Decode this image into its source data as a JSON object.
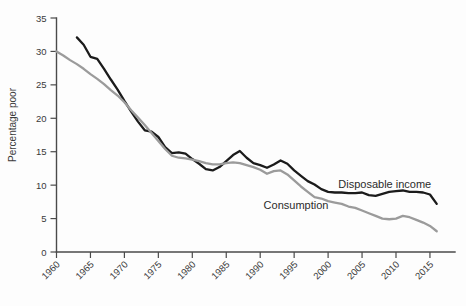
{
  "chart_data": {
    "type": "line",
    "title": "",
    "xlabel": "",
    "ylabel": "Percentage poor",
    "xlim": [
      1960,
      2017
    ],
    "ylim": [
      0,
      35
    ],
    "grid": false,
    "legend_position": "inline-annotations",
    "x_ticks": [
      1960,
      1965,
      1970,
      1975,
      1980,
      1985,
      1990,
      1995,
      2000,
      2005,
      2010,
      2015
    ],
    "x_tick_labels": [
      "1960",
      "1965",
      "1970",
      "1975",
      "1980",
      "1985",
      "1990",
      "1995",
      "2000",
      "2005",
      "2010",
      "2015"
    ],
    "y_ticks": [
      0,
      5,
      10,
      15,
      20,
      25,
      30,
      35
    ],
    "y_tick_labels": [
      "0",
      "5",
      "10",
      "15",
      "20",
      "25",
      "30",
      "35"
    ],
    "series": [
      {
        "name": "Disposable income",
        "color": "#1b1b1b",
        "label_x": 2001.5,
        "label_y": 9.6,
        "x": [
          1963,
          1964,
          1965,
          1966,
          1967,
          1968,
          1969,
          1970,
          1971,
          1972,
          1973,
          1974,
          1975,
          1976,
          1977,
          1978,
          1979,
          1980,
          1981,
          1982,
          1983,
          1984,
          1985,
          1986,
          1987,
          1988,
          1989,
          1990,
          1991,
          1992,
          1993,
          1994,
          1995,
          1996,
          1997,
          1998,
          1999,
          2000,
          2001,
          2002,
          2003,
          2004,
          2005,
          2006,
          2007,
          2008,
          2009,
          2010,
          2011,
          2012,
          2013,
          2014,
          2015,
          2016
        ],
        "values": [
          32.1,
          31.0,
          29.2,
          28.9,
          27.4,
          25.8,
          24.3,
          22.6,
          21.0,
          19.5,
          18.2,
          18.0,
          17.2,
          15.7,
          14.8,
          14.9,
          14.7,
          13.9,
          13.2,
          12.4,
          12.2,
          12.7,
          13.6,
          14.5,
          15.1,
          14.1,
          13.3,
          13.0,
          12.6,
          13.1,
          13.7,
          13.2,
          12.2,
          11.4,
          10.6,
          10.1,
          9.4,
          9.0,
          8.9,
          8.9,
          8.8,
          8.8,
          8.9,
          8.5,
          8.4,
          8.7,
          9.0,
          9.1,
          9.2,
          9.0,
          9.0,
          8.9,
          8.6,
          7.2
        ]
      },
      {
        "name": "Consumption",
        "color": "#9b9b9b",
        "label_x": 1990.5,
        "label_y": 6.4,
        "x": [
          1960,
          1961,
          1962,
          1963,
          1964,
          1965,
          1966,
          1967,
          1968,
          1969,
          1970,
          1971,
          1972,
          1973,
          1974,
          1975,
          1976,
          1977,
          1978,
          1979,
          1980,
          1981,
          1982,
          1983,
          1984,
          1985,
          1986,
          1987,
          1988,
          1989,
          1990,
          1991,
          1992,
          1993,
          1994,
          1995,
          1996,
          1997,
          1998,
          1999,
          2000,
          2001,
          2002,
          2003,
          2004,
          2005,
          2006,
          2007,
          2008,
          2009,
          2010,
          2011,
          2012,
          2013,
          2014,
          2015,
          2016
        ],
        "values": [
          30.0,
          29.4,
          28.7,
          28.1,
          27.4,
          26.6,
          25.9,
          25.1,
          24.2,
          23.4,
          22.4,
          21.2,
          20.1,
          19.0,
          17.8,
          16.6,
          15.4,
          14.4,
          14.1,
          14.0,
          13.8,
          13.6,
          13.3,
          13.1,
          13.1,
          13.3,
          13.4,
          13.3,
          13.0,
          12.7,
          12.3,
          11.7,
          12.1,
          12.2,
          11.6,
          10.7,
          9.8,
          9.0,
          8.2,
          8.0,
          7.6,
          7.4,
          7.2,
          6.8,
          6.6,
          6.2,
          5.8,
          5.4,
          5.0,
          4.9,
          5.0,
          5.4,
          5.2,
          4.8,
          4.4,
          3.9,
          3.1
        ]
      }
    ]
  },
  "axis": {
    "y_title": "Percentage poor"
  },
  "caption": {
    "text": ""
  }
}
